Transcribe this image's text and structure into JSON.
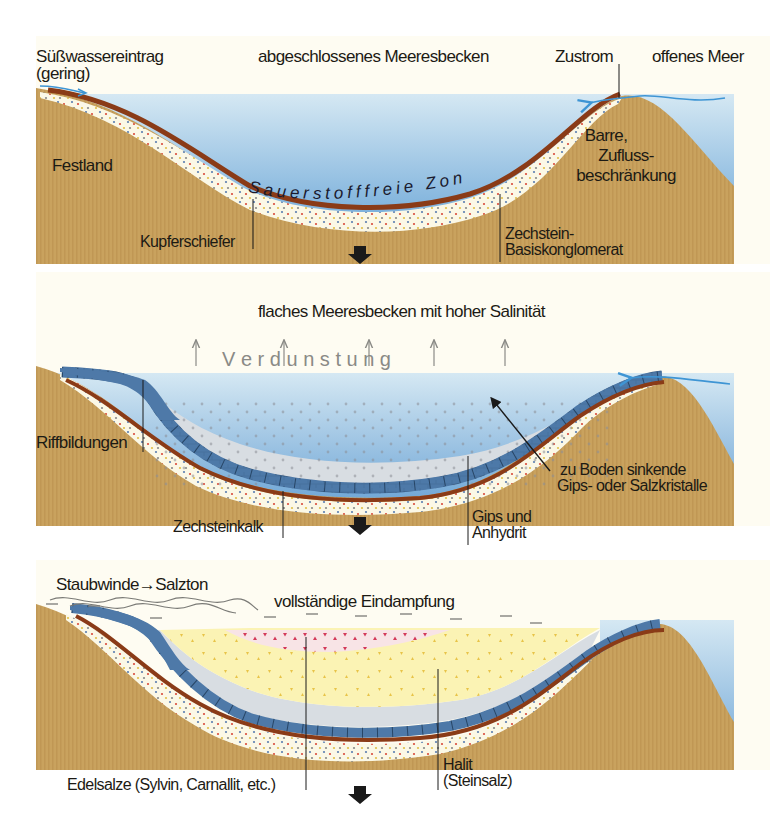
{
  "figure": {
    "topic": "Zechstein evaporite basin formation",
    "colors": {
      "background": "#fefcf2",
      "land": "#c9a25e",
      "land_stripe": "#bd9552",
      "sea_top": "#d3e6f2",
      "sea_bottom": "#7ab0dc",
      "kupferschiefer": "#8a3b17",
      "conglomerate": "#fbf8e6",
      "limestone": "#4d78a6",
      "anhydrite": "#d6dbe0",
      "halite": "#fbf3b4",
      "potash_salts": "#f7dfe4",
      "potash_marks": "#d43a5a",
      "halite_marks": "#e8c448",
      "arrow_flow": "#3e95d4",
      "sink_arrow": "#1a1a1a"
    }
  },
  "panels": [
    {
      "id": "stage-1",
      "title": "abgeschlossenes Meeresbecken",
      "labels": {
        "freshwater_line1": "Süßwassereintrag",
        "freshwater_line2": "(gering)",
        "inflow": "Zustrom",
        "open_sea": "offenes Meer",
        "mainland": "Festland",
        "barrier_line1": "Barre,",
        "barrier_line2": "Zufluss-",
        "barrier_line3": "beschränkung",
        "anoxic_zone": "Sauerstofffreie Zone",
        "kupferschiefer": "Kupferschiefer",
        "conglomerate_line1": "Zechstein-",
        "conglomerate_line2": "Basiskonglomerat"
      }
    },
    {
      "id": "stage-2",
      "title": "flaches Meeresbecken mit hoher Salinität",
      "labels": {
        "evaporation": "V e r d u n s t u n g",
        "reef": "Riffbildungen",
        "sinking_line1": "zu Boden sinkende",
        "sinking_line2": "Gips- oder Salzkristalle",
        "limestone": "Zechsteinkalk",
        "gypsum_line1": "Gips und",
        "gypsum_line2": "Anhydrit"
      }
    },
    {
      "id": "stage-3",
      "title": "vollständige Eindampfung",
      "labels": {
        "dust_winds": "Staubwinde→Salzton",
        "potash_salts": "Edelsalze (Sylvin, Carnallit, etc.)",
        "halite_line1": "Halit",
        "halite_line2": "(Steinsalz)"
      }
    }
  ]
}
